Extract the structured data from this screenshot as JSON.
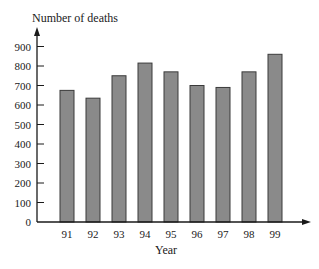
{
  "chart_data": {
    "type": "bar",
    "title": "",
    "ylabel": "Number of deaths",
    "xlabel": "Year",
    "categories": [
      "91",
      "92",
      "93",
      "94",
      "95",
      "96",
      "97",
      "98",
      "99"
    ],
    "values": [
      675,
      635,
      750,
      815,
      770,
      700,
      690,
      770,
      860
    ],
    "ylim": [
      0,
      900
    ],
    "yticks": [
      0,
      100,
      200,
      300,
      400,
      500,
      600,
      700,
      800,
      900
    ],
    "grid": false,
    "legend": null,
    "bar_color": "#8a8a8a",
    "bar_edge_color": "#3a3a3a",
    "axis_color": "#1a1a1a"
  }
}
